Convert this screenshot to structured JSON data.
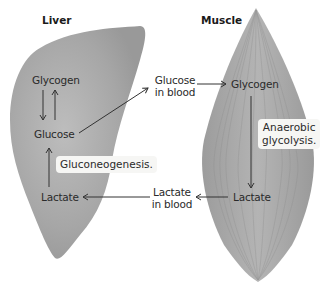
{
  "diagram": {
    "organs": {
      "liver": {
        "title": "Liver",
        "color": "#a9a9a9"
      },
      "muscle": {
        "title": "Muscle",
        "color": "#a3a3a3"
      }
    },
    "nodes": {
      "liver_glycogen": "Glycogen",
      "liver_glucose": "Glucose",
      "liver_lactate": "Lactate",
      "blood_glucose_line1": "Glucose",
      "blood_glucose_line2": "in blood",
      "blood_lactate_line1": "Lactate",
      "blood_lactate_line2": "in blood",
      "muscle_glycogen": "Glycogen",
      "muscle_lactate": "Lactate"
    },
    "process_labels": {
      "gluconeogenesis": "Gluconeogenesis.",
      "anaerobic_line1": "Anaerobic",
      "anaerobic_line2": "glycolysis."
    },
    "arrows": [
      {
        "from": "Glycogen (liver)",
        "to": "Glucose (liver)"
      },
      {
        "from": "Glucose (liver)",
        "to": "Glycogen (liver)"
      },
      {
        "from": "Glucose (liver)",
        "to": "Glucose in blood"
      },
      {
        "from": "Glucose in blood",
        "to": "Glycogen (muscle)"
      },
      {
        "from": "Glycogen (muscle)",
        "to": "Lactate (muscle)"
      },
      {
        "from": "Lactate (muscle)",
        "to": "Lactate in blood"
      },
      {
        "from": "Lactate in blood",
        "to": "Lactate (liver)"
      },
      {
        "from": "Lactate (liver)",
        "to": "Glucose (liver)"
      }
    ],
    "colors": {
      "arrow": "#333333",
      "label_box": "#f6f6f4"
    }
  }
}
